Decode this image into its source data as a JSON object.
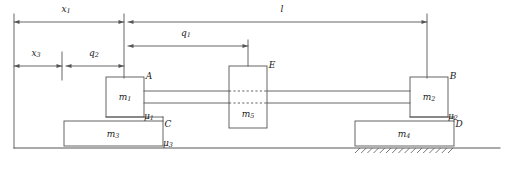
{
  "diagram": {
    "stroke_color": "#555555",
    "text_color": "#1a1a1a",
    "background": "#ffffff",
    "width": 507,
    "height": 169
  },
  "dimensions": [
    {
      "id": "x1",
      "label": "x",
      "sub": "1",
      "from_x": 14,
      "to_x": 124,
      "y": 22,
      "text_x": 66,
      "text_y": 12
    },
    {
      "id": "l",
      "label": "l",
      "sub": "",
      "from_x": 128,
      "to_x": 427,
      "y": 22,
      "text_x": 282,
      "text_y": 12
    },
    {
      "id": "q1",
      "label": "q",
      "sub": "1",
      "from_x": 128,
      "to_x": 248,
      "y": 46,
      "text_x": 186,
      "text_y": 36
    },
    {
      "id": "x3",
      "label": "x",
      "sub": "3",
      "from_x": 14,
      "to_x": 62,
      "y": 66,
      "text_x": 36,
      "text_y": 56
    },
    {
      "id": "q2",
      "label": "q",
      "sub": "2",
      "from_x": 66,
      "to_x": 124,
      "y": 66,
      "text_x": 94,
      "text_y": 56
    }
  ],
  "masses": [
    {
      "id": "m1",
      "label": "m",
      "sub": "1",
      "x": 106,
      "y": 77,
      "w": 38,
      "h": 40,
      "text_x": 125,
      "text_y": 100
    },
    {
      "id": "m5",
      "label": "m",
      "sub": "5",
      "x": 229,
      "y": 66,
      "w": 38,
      "h": 62,
      "text_x": 248,
      "text_y": 117
    },
    {
      "id": "m2",
      "label": "m",
      "sub": "2",
      "x": 410,
      "y": 77,
      "w": 38,
      "h": 40,
      "text_x": 429,
      "text_y": 100
    },
    {
      "id": "m3",
      "label": "m",
      "sub": "3",
      "x": 64,
      "y": 121,
      "w": 99,
      "h": 25,
      "text_x": 113,
      "text_y": 137
    },
    {
      "id": "m4",
      "label": "m",
      "sub": "4",
      "x": 355,
      "y": 121,
      "w": 99,
      "h": 25,
      "text_x": 404,
      "text_y": 137
    }
  ],
  "point_labels": [
    {
      "id": "A",
      "text": "A",
      "x": 149,
      "y": 79
    },
    {
      "id": "E",
      "text": "E",
      "x": 272,
      "y": 68
    },
    {
      "id": "B",
      "text": "B",
      "x": 453,
      "y": 79
    },
    {
      "id": "C",
      "text": "C",
      "x": 168,
      "y": 127
    },
    {
      "id": "D",
      "text": "D",
      "x": 459,
      "y": 127
    }
  ],
  "friction_labels": [
    {
      "id": "mu1",
      "label": "μ",
      "sub": "1",
      "x": 149,
      "y": 119
    },
    {
      "id": "mu2",
      "label": "μ",
      "sub": "2",
      "x": 453,
      "y": 119
    },
    {
      "id": "mu3",
      "label": "μ",
      "sub": "3",
      "x": 168,
      "y": 146
    }
  ],
  "rods": {
    "upper_y": 91,
    "lower_y": 103,
    "left_start_x": 144,
    "right_end_x": 410
  },
  "ground": {
    "y": 148,
    "from_x": 14,
    "to_x": 500,
    "hatch_from_x": 355,
    "hatch_to_x": 454
  },
  "reference_lines": [
    {
      "id": "left-datum",
      "x": 14,
      "y1": 14,
      "y2": 148
    },
    {
      "id": "x3-datum",
      "x": 62,
      "y1": 52,
      "y2": 80
    },
    {
      "id": "m1-datum",
      "x": 124,
      "y1": 14,
      "y2": 78
    },
    {
      "id": "m5-datum",
      "x": 248,
      "y1": 40,
      "y2": 66
    },
    {
      "id": "m2-datum",
      "x": 427,
      "y1": 14,
      "y2": 78
    }
  ]
}
